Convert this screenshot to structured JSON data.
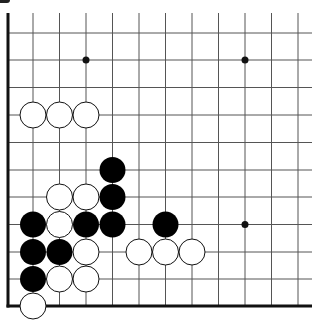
{
  "board": {
    "type": "go-board-fragment",
    "columns_x": [
      33,
      59.5,
      86,
      112.5,
      139,
      165.5,
      192,
      218.5,
      245,
      271.5,
      298
    ],
    "rows_y": [
      6,
      33,
      60,
      87.5,
      115,
      142.5,
      170,
      197,
      224.5,
      252,
      279,
      306
    ],
    "left_edge_x": 8,
    "bottom_edge_y": 306,
    "stone_radius": 13,
    "colors": {
      "line": "#555555",
      "edge": "#111111",
      "black_stone": "#000000",
      "white_stone": "#ffffff",
      "stone_outline": "#111111"
    },
    "star_points": [
      {
        "col": 2,
        "row": 2
      },
      {
        "col": 8,
        "row": 2
      },
      {
        "col": 8,
        "row": 8
      }
    ],
    "stones": [
      {
        "color": "white",
        "col": 0,
        "row": 4
      },
      {
        "color": "white",
        "col": 1,
        "row": 4
      },
      {
        "color": "white",
        "col": 2,
        "row": 4
      },
      {
        "color": "black",
        "col": 3,
        "row": 6
      },
      {
        "color": "black",
        "col": 3,
        "row": 7
      },
      {
        "color": "white",
        "col": 1,
        "row": 7
      },
      {
        "color": "white",
        "col": 2,
        "row": 7
      },
      {
        "color": "black",
        "col": 0,
        "row": 8
      },
      {
        "color": "white",
        "col": 1,
        "row": 8
      },
      {
        "color": "black",
        "col": 2,
        "row": 8
      },
      {
        "color": "black",
        "col": 3,
        "row": 8
      },
      {
        "color": "black",
        "col": 5,
        "row": 8
      },
      {
        "color": "black",
        "col": 0,
        "row": 9
      },
      {
        "color": "black",
        "col": 1,
        "row": 9
      },
      {
        "color": "white",
        "col": 2,
        "row": 9
      },
      {
        "color": "white",
        "col": 4,
        "row": 9
      },
      {
        "color": "white",
        "col": 5,
        "row": 9
      },
      {
        "color": "white",
        "col": 6,
        "row": 9
      },
      {
        "color": "black",
        "col": 0,
        "row": 10
      },
      {
        "color": "white",
        "col": 1,
        "row": 10
      },
      {
        "color": "white",
        "col": 2,
        "row": 10
      },
      {
        "color": "white",
        "col": 0,
        "row": 11
      }
    ]
  }
}
